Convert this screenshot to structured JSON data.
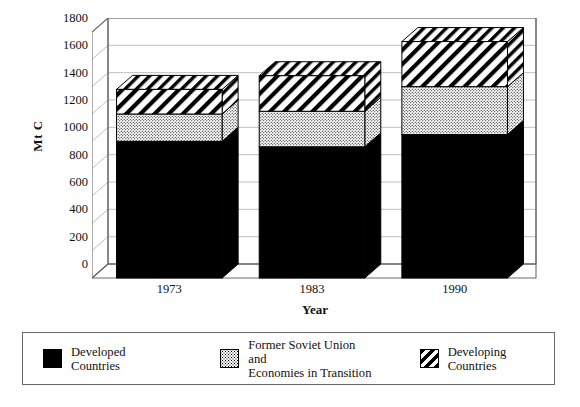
{
  "chart_data": {
    "type": "bar",
    "subtype": "stacked-3d-column",
    "title": "",
    "xlabel": "Year",
    "ylabel": "Mt C",
    "categories": [
      "1973",
      "1983",
      "1990"
    ],
    "ylim": [
      0,
      1800
    ],
    "ytick_step": 200,
    "yticks": [
      1800,
      1600,
      1400,
      1200,
      1000,
      800,
      600,
      400,
      200,
      0
    ],
    "grid": true,
    "grid_axis": "y",
    "legend_position": "bottom",
    "series": [
      {
        "name": "Developed Countries",
        "pattern": "solid",
        "color": "#000000",
        "values": [
          1000,
          960,
          1050
        ]
      },
      {
        "name": "Former Soviet Union and\nEconomies in Transition",
        "pattern": "dotted",
        "color": "#ffffff",
        "values": [
          200,
          260,
          350
        ]
      },
      {
        "name": "Developing Countries",
        "pattern": "diagonal-hatch",
        "color": "#ffffff",
        "values": [
          180,
          260,
          330
        ]
      }
    ],
    "totals": [
      1380,
      1480,
      1730
    ],
    "cumulative": [
      [
        1000,
        1200,
        1380
      ],
      [
        960,
        1220,
        1480
      ],
      [
        1050,
        1400,
        1730
      ]
    ]
  },
  "axes": {
    "y_title": "Mt C",
    "x_title": "Year",
    "y_tick_labels": [
      "1800",
      "1600",
      "1400",
      "1200",
      "1000",
      "800",
      "600",
      "400",
      "200",
      "0"
    ],
    "x_tick_labels": [
      "1973",
      "1983",
      "1990"
    ]
  },
  "legend": {
    "items": [
      {
        "label": "Developed Countries",
        "pattern": "solid"
      },
      {
        "label": "Former Soviet Union and\nEconomies in Transition",
        "pattern": "dotted"
      },
      {
        "label": "Developing Countries",
        "pattern": "diagonal-hatch"
      }
    ]
  },
  "colors": {
    "frame": "#6a6a6a",
    "grid": "#b8b8b8",
    "bar_outline": "#000000",
    "solid_fill": "#000000",
    "background": "#ffffff"
  }
}
